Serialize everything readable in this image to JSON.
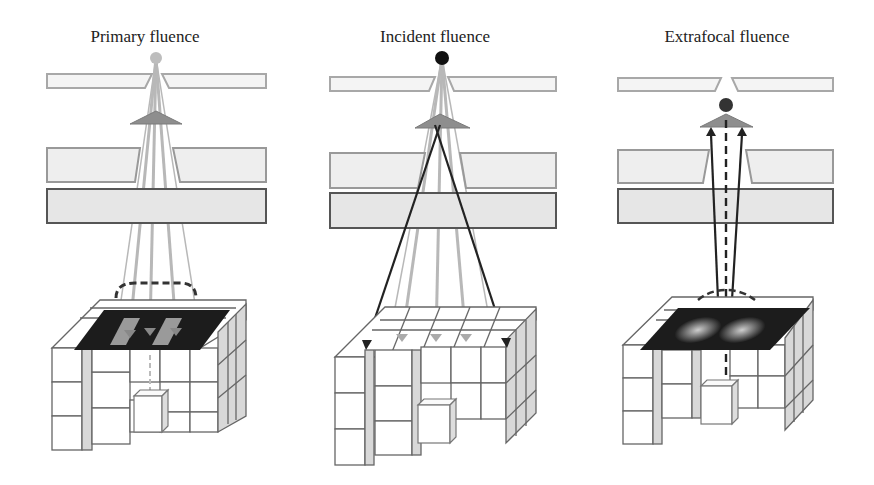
{
  "diagram": {
    "type": "radiotherapy fluence model schematic",
    "panels": [
      {
        "title": "Primary fluence",
        "source_color": "#bbbbbb",
        "description": "gray rays from focal source through jaws/collimator to fluence plane over voxel phantom; dashed profile above plane"
      },
      {
        "title": "Incident fluence",
        "source_color": "#111111",
        "description": "gray primary rays plus dark black crossing rays from flattening filter (extrafocal) reaching phantom edges"
      },
      {
        "title": "Extrafocal fluence",
        "source_color": "#333333",
        "description": "upward arrows from fluence plane back to flattening filter; dashed central ray; blurred fluence plane"
      }
    ],
    "colors": {
      "jaw_fill": "#f0f0f0",
      "jaw_stroke": "#9a9a9a",
      "collimator_stroke": "#555555",
      "filter_fill": "#8a8a8a",
      "ray_gray": "#b5b5b5",
      "ray_dark": "#222222",
      "plane_dark": "#1a1a1a",
      "voxel_stroke": "#666666",
      "voxel_side": "#d6d6d6"
    }
  }
}
